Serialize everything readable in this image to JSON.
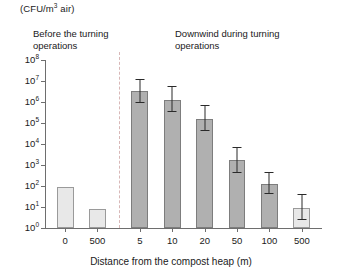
{
  "figure": {
    "unit_label_prefix": "(CFU/m",
    "unit_label_exponent": "3",
    "unit_label_suffix": " air)",
    "group_before_line1": "Before the turning",
    "group_before_line2": "operations",
    "group_downwind_line1": "Downwind during turning",
    "group_downwind_line2": "operations",
    "xaxis_title": "Distance from the compost heap (m)"
  },
  "chart_data": {
    "type": "bar",
    "title": "",
    "subtitle": "",
    "xlabel": "Distance from the compost heap (m)",
    "ylabel": "(CFU/m3 air)",
    "yscale": "log",
    "ylim": [
      1,
      100000000
    ],
    "grid": false,
    "legend": null,
    "ytick_labels": [
      "10^8",
      "10^7",
      "10^6",
      "10^5",
      "10^4",
      "10^3",
      "10^2",
      "10^1",
      "10^0"
    ],
    "ytick_mantissa": [
      "10",
      "10",
      "10",
      "10",
      "10",
      "10",
      "10",
      "10",
      "10"
    ],
    "ytick_exponents": [
      "8",
      "7",
      "6",
      "5",
      "4",
      "3",
      "2",
      "1",
      "0"
    ],
    "ytick_values": [
      100000000,
      10000000,
      1000000,
      100000,
      10000,
      1000,
      100,
      10,
      1
    ],
    "categories": [
      "0",
      "500",
      "5",
      "10",
      "20",
      "50",
      "100",
      "500"
    ],
    "groups": [
      {
        "name": "Before the turning operations",
        "categories": [
          "0",
          "500"
        ]
      },
      {
        "name": "Downwind during turning operations",
        "categories": [
          "5",
          "10",
          "20",
          "50",
          "100",
          "500"
        ]
      }
    ],
    "values": [
      90,
      8,
      3500000,
      1300000,
      150000,
      1800,
      130,
      9
    ],
    "error_low": [
      null,
      null,
      900000,
      350000,
      40000,
      430,
      40,
      2.5
    ],
    "error_high": [
      null,
      null,
      13000000,
      5500000,
      700000,
      7500,
      470,
      40
    ],
    "bars": [
      {
        "category": "0",
        "group": "before",
        "value": 90,
        "err_low": null,
        "err_high": null,
        "fill": "light"
      },
      {
        "category": "500",
        "group": "before",
        "value": 8,
        "err_low": null,
        "err_high": null,
        "fill": "light"
      },
      {
        "category": "5",
        "group": "downwind",
        "value": 3500000,
        "err_low": 900000,
        "err_high": 13000000,
        "fill": "dark"
      },
      {
        "category": "10",
        "group": "downwind",
        "value": 1300000,
        "err_low": 350000,
        "err_high": 5500000,
        "fill": "dark"
      },
      {
        "category": "20",
        "group": "downwind",
        "value": 150000,
        "err_low": 40000,
        "err_high": 700000,
        "fill": "dark"
      },
      {
        "category": "50",
        "group": "downwind",
        "value": 1800,
        "err_low": 430,
        "err_high": 7500,
        "fill": "dark"
      },
      {
        "category": "100",
        "group": "downwind",
        "value": 130,
        "err_low": 40,
        "err_high": 470,
        "fill": "dark"
      },
      {
        "category": "500",
        "group": "downwind",
        "value": 9,
        "err_low": 2.5,
        "err_high": 40,
        "fill": "light"
      }
    ],
    "colors": {
      "bar_light": "#e8e8e8",
      "bar_dark": "#b0b0b0",
      "bar_edge": "#808080",
      "error_bar": "#2a2a2a",
      "axis": "#6e6e6e",
      "divider": "#d8b7b7"
    }
  }
}
